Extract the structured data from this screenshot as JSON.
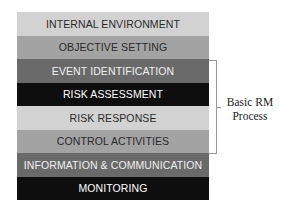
{
  "diagram": {
    "type": "stacked-layer-diagram",
    "layers": [
      {
        "label": "INTERNAL ENVIRONMENT",
        "bg": "#d2d2d2",
        "fg": "#2a2a2a"
      },
      {
        "label": "OBJECTIVE SETTING",
        "bg": "#a3a3a3",
        "fg": "#2a2a2a"
      },
      {
        "label": "EVENT IDENTIFICATION",
        "bg": "#6a6a6a",
        "fg": "#f0f0f0"
      },
      {
        "label": "RISK ASSESSMENT",
        "bg": "#0e0e0e",
        "fg": "#ffffff"
      },
      {
        "label": "RISK RESPONSE",
        "bg": "#d2d2d2",
        "fg": "#2a2a2a"
      },
      {
        "label": "CONTROL ACTIVITIES",
        "bg": "#a3a3a3",
        "fg": "#2a2a2a"
      },
      {
        "label": "INFORMATION & COMMUNICATION",
        "bg": "#6a6a6a",
        "fg": "#f0f0f0"
      },
      {
        "label": "MONITORING",
        "bg": "#0e0e0e",
        "fg": "#ffffff"
      }
    ],
    "bracket": {
      "spans": [
        "EVENT IDENTIFICATION",
        "RISK ASSESSMENT",
        "RISK RESPONSE",
        "CONTROL ACTIVITIES"
      ],
      "label_line1": "Basic RM",
      "label_line2": "Process"
    }
  }
}
